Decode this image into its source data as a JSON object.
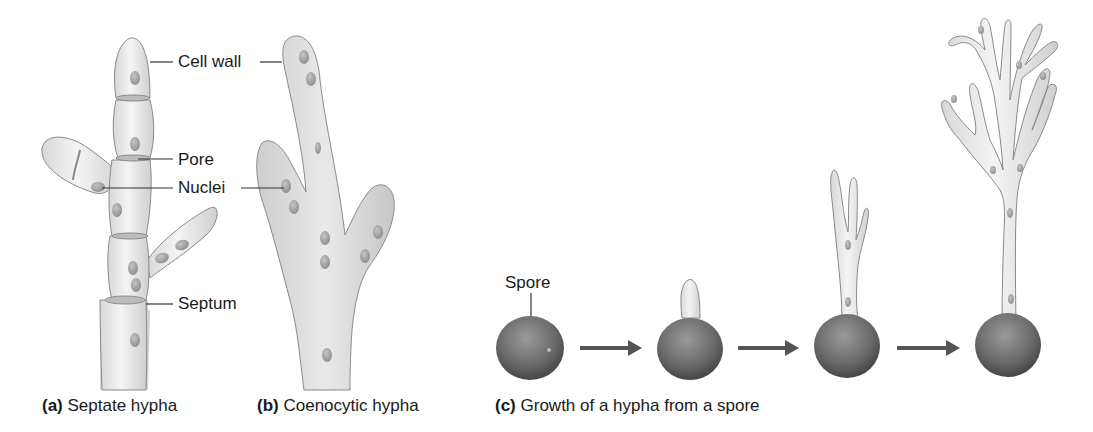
{
  "panels": {
    "a": {
      "letter": "(a)",
      "caption": "Septate hypha",
      "labels": {
        "cell_wall": "Cell wall",
        "pore": "Pore",
        "nuclei": "Nuclei",
        "septum": "Septum"
      }
    },
    "b": {
      "letter": "(b)",
      "caption": "Coenocytic hypha"
    },
    "c": {
      "letter": "(c)",
      "caption": "Growth of a hypha from a spore",
      "labels": {
        "spore": "Spore"
      },
      "stages": 4
    }
  },
  "colors": {
    "hypha_fill": "#e6e6e6",
    "hypha_stroke": "#8a8a8a",
    "nucleus": "#a8a8a8",
    "spore": "#6e6e6e",
    "arrow": "#555555",
    "text": "#1a1a1a"
  }
}
